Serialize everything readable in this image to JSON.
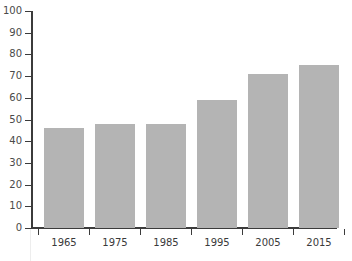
{
  "chart_data": {
    "type": "bar",
    "title": "",
    "xlabel": "",
    "ylabel": "",
    "categories": [
      "1965",
      "1975",
      "1985",
      "1995",
      "2005",
      "2015"
    ],
    "values": [
      46,
      48,
      48,
      59,
      71,
      75
    ],
    "ylim": [
      0,
      100
    ],
    "yticks": [
      0,
      10,
      20,
      30,
      40,
      50,
      60,
      70,
      80,
      90,
      100
    ],
    "ytick_labels": [
      "0",
      "10",
      "20",
      "30",
      "40",
      "50",
      "60",
      "70",
      "80",
      "90",
      "100"
    ],
    "grid": false,
    "legend": null,
    "bar_color": "#b4b4b4",
    "axis_color": "#3b3b3b",
    "background_color": "#ffffff",
    "tick_label_color": "#3a3a3a"
  },
  "clipped_title": {
    "text": "",
    "note": "cropped-off text row at top edge"
  }
}
